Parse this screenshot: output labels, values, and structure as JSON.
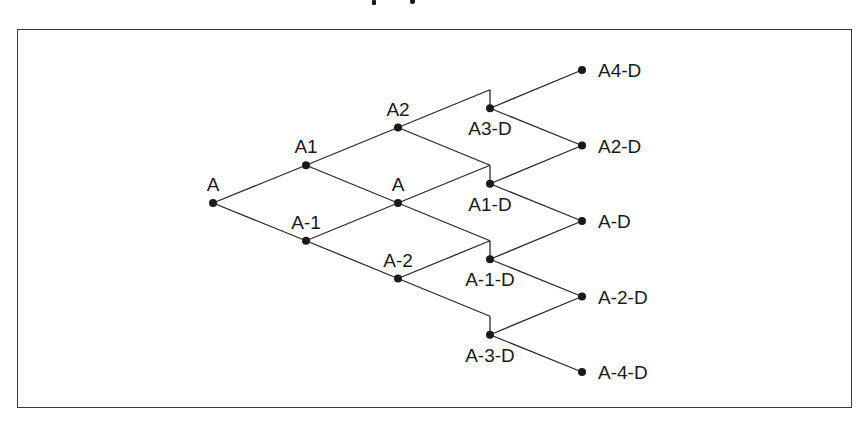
{
  "figure": {
    "title_visible": false
  },
  "tree": {
    "columns": [
      {
        "step": 0,
        "nodes": [
          {
            "id": "n0_0",
            "label": "A",
            "label_pos": "above"
          }
        ]
      },
      {
        "step": 1,
        "nodes": [
          {
            "id": "n1_0",
            "label": "A1",
            "label_pos": "above"
          },
          {
            "id": "n1_1",
            "label": "A-1",
            "label_pos": "above"
          }
        ]
      },
      {
        "step": 2,
        "nodes": [
          {
            "id": "n2_0",
            "label": "A2",
            "label_pos": "above"
          },
          {
            "id": "n2_1",
            "label": "A",
            "label_pos": "above"
          },
          {
            "id": "n2_2",
            "label": "A-2",
            "label_pos": "above"
          }
        ]
      },
      {
        "step": 3,
        "dividend_drop": true,
        "nodes": [
          {
            "id": "n3_0",
            "label": "A3-D",
            "label_pos": "below"
          },
          {
            "id": "n3_1",
            "label": "A1-D",
            "label_pos": "below"
          },
          {
            "id": "n3_2",
            "label": "A-1-D",
            "label_pos": "below"
          },
          {
            "id": "n3_3",
            "label": "A-3-D",
            "label_pos": "below"
          }
        ]
      },
      {
        "step": 4,
        "nodes": [
          {
            "id": "n4_0",
            "label": "A4-D",
            "label_pos": "right"
          },
          {
            "id": "n4_1",
            "label": "A2-D",
            "label_pos": "right"
          },
          {
            "id": "n4_2",
            "label": "A-D",
            "label_pos": "right"
          },
          {
            "id": "n4_3",
            "label": "A-2-D",
            "label_pos": "right"
          },
          {
            "id": "n4_4",
            "label": "A-4-D",
            "label_pos": "right"
          }
        ]
      }
    ]
  }
}
